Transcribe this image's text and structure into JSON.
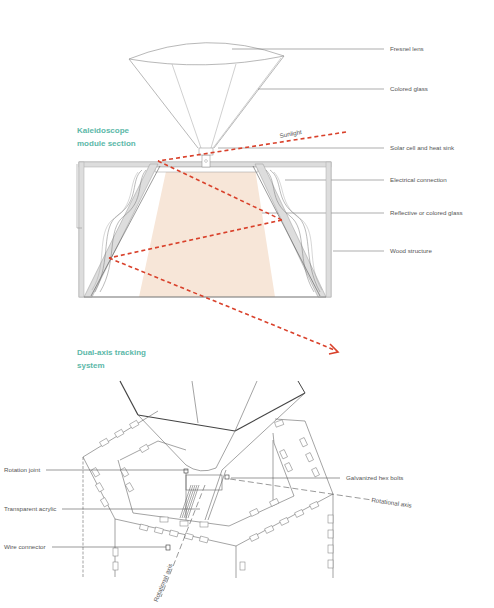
{
  "sections": {
    "kaleidoscope": {
      "title_line1": "Kaleidoscope",
      "title_line2": "module section"
    },
    "tracking": {
      "title_line1": "Dual-axis tracking",
      "title_line2": "system"
    }
  },
  "labels": {
    "fresnel_lens": "Fresnel lens",
    "colored_glass": "Colored glass",
    "sunlight": "Sunlight",
    "solar_cell": "Solar cell and heat sink",
    "electrical_connection": "Electrical connection",
    "reflective_glass": "Reflective or colored glass",
    "wood_structure": "Wood structure",
    "rotation_joint": "Rotation joint",
    "galvanized_bolts": "Galvanized hex bolts",
    "transparent_acrylic": "Transparent acrylic",
    "rotational_axis_1": "Rotational axis",
    "wire_connector": "Wire connector",
    "rotational_axis_2": "Rotational axis"
  },
  "colors": {
    "accent_title": "#5cb8a8",
    "sunlight_ray": "#d9412b",
    "light_cone_fill": "#f7e6d8",
    "line": "#777777"
  }
}
